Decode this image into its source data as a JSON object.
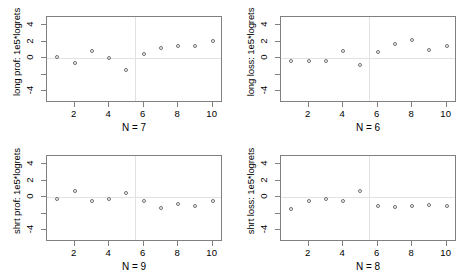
{
  "figure": {
    "background": "#ffffff",
    "point_color": "#6e6e6e",
    "axis_color": "#808080",
    "grid_color": "#e2e2e2",
    "layout": "2x2 panel grid"
  },
  "chart_data": [
    {
      "type": "scatter",
      "panel": "top-left",
      "title": "",
      "ylabel": "long prof: 1e5*logrets",
      "xlabel": "N = 7",
      "xlim": [
        0.4,
        10.6
      ],
      "ylim": [
        -5.4,
        5.0
      ],
      "xticks": [
        2,
        4,
        6,
        8,
        10
      ],
      "yticks": [
        -4,
        -2,
        0,
        2,
        4
      ],
      "ytick_labels": [
        "-4",
        "",
        "0",
        "2",
        "4"
      ],
      "grid": false,
      "reference_lines": {
        "hline_y": 0,
        "vline_x": 5.5
      },
      "x": [
        1,
        2,
        3,
        4,
        5,
        6,
        7,
        8,
        9,
        10
      ],
      "y": [
        0.15,
        -0.55,
        0.85,
        0.05,
        -1.45,
        0.55,
        1.25,
        1.55,
        1.45,
        2.1
      ]
    },
    {
      "type": "scatter",
      "panel": "top-right",
      "title": "",
      "ylabel": "long loss: 1e5*logrets",
      "xlabel": "N = 6",
      "xlim": [
        0.4,
        10.6
      ],
      "ylim": [
        -5.4,
        5.0
      ],
      "xticks": [
        2,
        4,
        6,
        8,
        10
      ],
      "yticks": [
        -4,
        -2,
        0,
        2,
        4
      ],
      "ytick_labels": [
        "-4",
        "",
        "0",
        "2",
        "4"
      ],
      "grid": false,
      "reference_lines": {
        "hline_y": 0,
        "vline_x": 5.5
      },
      "x": [
        1,
        2,
        3,
        4,
        5,
        6,
        7,
        8,
        9,
        10
      ],
      "y": [
        -0.3,
        -0.3,
        -0.3,
        0.9,
        -0.75,
        0.8,
        1.7,
        2.2,
        0.95,
        1.5
      ]
    },
    {
      "type": "scatter",
      "panel": "bottom-left",
      "title": "",
      "ylabel": "shrt prof: 1e5*logrets",
      "xlabel": "N = 9",
      "xlim": [
        0.4,
        10.6
      ],
      "ylim": [
        -5.4,
        5.0
      ],
      "xticks": [
        2,
        4,
        6,
        8,
        10
      ],
      "yticks": [
        -4,
        -2,
        0,
        2,
        4
      ],
      "ytick_labels": [
        "-4",
        "",
        "0",
        "2",
        "4"
      ],
      "grid": false,
      "reference_lines": {
        "hline_y": 0,
        "vline_x": 5.5
      },
      "x": [
        1,
        2,
        3,
        4,
        5,
        6,
        7,
        8,
        9,
        10
      ],
      "y": [
        -0.2,
        0.8,
        -0.5,
        -0.25,
        0.5,
        -0.5,
        -1.3,
        -0.75,
        -1.05,
        -0.45
      ]
    },
    {
      "type": "scatter",
      "panel": "bottom-right",
      "title": "",
      "ylabel": "shrt loss: 1e5*logrets",
      "xlabel": "N = 8",
      "xlim": [
        0.4,
        10.6
      ],
      "ylim": [
        -5.4,
        5.0
      ],
      "xticks": [
        2,
        4,
        6,
        8,
        10
      ],
      "yticks": [
        -4,
        -2,
        0,
        2,
        4
      ],
      "ytick_labels": [
        "-4",
        "",
        "0",
        "2",
        "4"
      ],
      "grid": false,
      "reference_lines": {
        "hline_y": 0,
        "vline_x": 5.5
      },
      "x": [
        1,
        2,
        3,
        4,
        5,
        6,
        7,
        8,
        9,
        10
      ],
      "y": [
        -1.35,
        -0.5,
        -0.2,
        -0.5,
        0.8,
        -1.0,
        -1.2,
        -1.1,
        -0.95,
        -1.0
      ]
    }
  ]
}
